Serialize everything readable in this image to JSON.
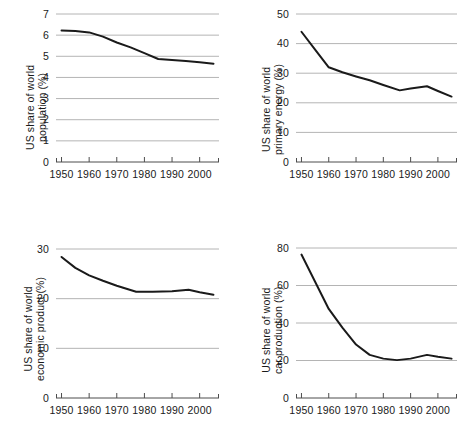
{
  "figure": {
    "layout": "2x2 grid of line charts",
    "panel_order": [
      "population",
      "primary_energy",
      "economic_product",
      "car_production"
    ]
  },
  "chart_data": [
    {
      "id": "population",
      "type": "line",
      "title": "",
      "xlabel": "",
      "ylabel": "US share of world population (%)",
      "ylabel_lines": [
        "US share of world",
        "population (%)"
      ],
      "xlim": [
        1948,
        2007
      ],
      "ylim": [
        0,
        7
      ],
      "yticks": [
        0,
        1,
        2,
        3,
        4,
        5,
        6,
        7
      ],
      "ytick_labels": [
        "0",
        "1",
        "2",
        "3",
        "4",
        "5",
        "6",
        "7"
      ],
      "xticks": [
        1950,
        1960,
        1970,
        1980,
        1990,
        2000
      ],
      "xtick_labels": [
        "1950",
        "1960",
        "1970",
        "1980",
        "1990",
        "2000"
      ],
      "grid": "horizontal",
      "legend": "none",
      "line_color": "#1a1a1a",
      "x": [
        1950,
        1955,
        1960,
        1965,
        1970,
        1975,
        1980,
        1985,
        1990,
        1995,
        2000,
        2005
      ],
      "values": [
        6.22,
        6.2,
        6.13,
        5.93,
        5.65,
        5.42,
        5.15,
        4.87,
        4.83,
        4.78,
        4.72,
        4.65
      ]
    },
    {
      "id": "primary_energy",
      "type": "line",
      "title": "",
      "xlabel": "",
      "ylabel": "US share of world primary energy (%)",
      "ylabel_lines": [
        "US share of world",
        "primary energy (%)"
      ],
      "xlim": [
        1948,
        2007
      ],
      "ylim": [
        0,
        50
      ],
      "yticks": [
        0,
        10,
        20,
        30,
        40,
        50
      ],
      "ytick_labels": [
        "0",
        "10",
        "20",
        "30",
        "40",
        "50"
      ],
      "xticks": [
        1950,
        1960,
        1970,
        1980,
        1990,
        2000
      ],
      "xtick_labels": [
        "1950",
        "1960",
        "1970",
        "1980",
        "1990",
        "2000"
      ],
      "grid": "horizontal",
      "legend": "none",
      "line_color": "#1a1a1a",
      "x": [
        1950,
        1955,
        1960,
        1965,
        1970,
        1975,
        1980,
        1986,
        1990,
        1996,
        2000,
        2005
      ],
      "values": [
        44.0,
        38.0,
        32.0,
        30.3,
        28.9,
        27.6,
        26.0,
        24.2,
        24.8,
        25.6,
        24.0,
        22.1
      ]
    },
    {
      "id": "economic_product",
      "type": "line",
      "title": "",
      "xlabel": "",
      "ylabel": "US share of world economic product (%)",
      "ylabel_lines": [
        "US share of world",
        "economic product (%)"
      ],
      "xlim": [
        1948,
        2007
      ],
      "ylim": [
        0,
        30
      ],
      "yticks": [
        0,
        10,
        20,
        30
      ],
      "ytick_labels": [
        "0",
        "10",
        "20",
        "30"
      ],
      "xticks": [
        1950,
        1960,
        1970,
        1980,
        1990,
        2000
      ],
      "xtick_labels": [
        "1950",
        "1960",
        "1970",
        "1980",
        "1990",
        "2000"
      ],
      "grid": "horizontal",
      "legend": "none",
      "line_color": "#1a1a1a",
      "x": [
        1950,
        1955,
        1960,
        1965,
        1970,
        1977,
        1983,
        1990,
        1996,
        2000,
        2005
      ],
      "values": [
        28.4,
        26.2,
        24.7,
        23.6,
        22.6,
        21.4,
        21.4,
        21.5,
        21.8,
        21.3,
        20.8
      ]
    },
    {
      "id": "car_production",
      "type": "line",
      "title": "",
      "xlabel": "",
      "ylabel": "US share of world car production (%)",
      "ylabel_lines": [
        "US share of world",
        "car production (%)"
      ],
      "xlim": [
        1948,
        2007
      ],
      "ylim": [
        0,
        80
      ],
      "yticks": [
        0,
        20,
        40,
        60,
        80
      ],
      "ytick_labels": [
        "0",
        "20",
        "40",
        "60",
        "80"
      ],
      "xticks": [
        1950,
        1960,
        1970,
        1980,
        1990,
        2000
      ],
      "xtick_labels": [
        "1950",
        "1960",
        "1970",
        "1980",
        "1990",
        "2000"
      ],
      "grid": "horizontal",
      "legend": "none",
      "line_color": "#1a1a1a",
      "x": [
        1950,
        1955,
        1960,
        1965,
        1970,
        1975,
        1980,
        1985,
        1990,
        1996,
        2000,
        2005
      ],
      "values": [
        76.5,
        62.0,
        47.5,
        37.5,
        28.5,
        23.0,
        21.0,
        20.2,
        21.0,
        23.0,
        22.0,
        21.0
      ]
    }
  ],
  "style": {
    "gridline_color": "#b4b4b4",
    "axis_color": "#4d4d4d",
    "line_color": "#1a1a1a",
    "text_color": "#1a1a1a",
    "background": "#ffffff"
  }
}
